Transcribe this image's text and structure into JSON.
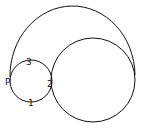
{
  "diagram": {
    "labels": {
      "p": "P",
      "one": "1",
      "two": "2",
      "three": "3"
    },
    "stroke_color": "#111111",
    "background": "#ffffff"
  }
}
